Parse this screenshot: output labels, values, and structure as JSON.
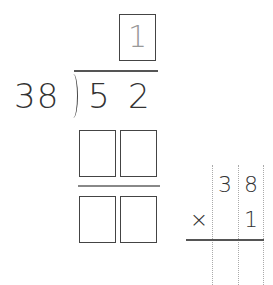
{
  "division": {
    "divisor": "38",
    "dividend_digits": [
      "5",
      "2"
    ],
    "quotient_hint": "1",
    "product_boxes": [
      "",
      ""
    ],
    "remainder_boxes": [
      "",
      ""
    ]
  },
  "multiplication": {
    "top_digits": [
      "3",
      "8"
    ],
    "operator": "×",
    "bottom_digits": [
      "",
      "1"
    ]
  }
}
